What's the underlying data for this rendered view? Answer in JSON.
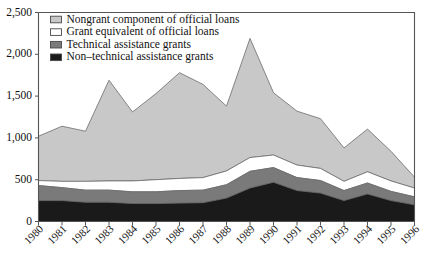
{
  "chart_data": {
    "type": "area",
    "stacked": true,
    "title": "",
    "subtitle": "",
    "xlabel": "",
    "ylabel": "",
    "grid": false,
    "legend_position": "top-left",
    "categories": [
      "1980",
      "1981",
      "1982",
      "1983",
      "1984",
      "1985",
      "1986",
      "1987",
      "1988",
      "1989",
      "1990",
      "1991",
      "1992",
      "1993",
      "1994",
      "1995",
      "1996"
    ],
    "x": [
      1980,
      1981,
      1982,
      1983,
      1984,
      1985,
      1986,
      1987,
      1988,
      1989,
      1990,
      1991,
      1992,
      1993,
      1994,
      1995,
      1996
    ],
    "ylim": [
      0,
      2500
    ],
    "xlim": [
      1980,
      1996
    ],
    "ytick_labels": [
      "0",
      "500",
      "1,000",
      "1,500",
      "2,000",
      "2,500"
    ],
    "ytick_values": [
      0,
      500,
      1000,
      1500,
      2000,
      2500
    ],
    "series": [
      {
        "name": "Non-technical assistance grants",
        "color": "#1a1a1a",
        "values": [
          250,
          250,
          230,
          230,
          215,
          215,
          220,
          225,
          280,
          400,
          470,
          370,
          340,
          250,
          330,
          250,
          200
        ]
      },
      {
        "name": "Technical assistance grants",
        "color": "#7a7a7a",
        "values": [
          180,
          155,
          145,
          145,
          140,
          140,
          150,
          150,
          160,
          200,
          175,
          155,
          150,
          120,
          130,
          110,
          95
        ]
      },
      {
        "name": "Grant equivalent of official loans",
        "color": "#ffffff",
        "values": [
          60,
          75,
          105,
          110,
          130,
          145,
          145,
          150,
          165,
          165,
          150,
          150,
          145,
          110,
          135,
          125,
          105
        ]
      },
      {
        "name": "Nongrant component of official loans",
        "color": "#c8c8c8",
        "values": [
          530,
          660,
          600,
          1205,
          825,
          1030,
          1265,
          1115,
          775,
          1425,
          745,
          645,
          595,
          400,
          510,
          355,
          130
        ]
      }
    ],
    "stack_tops": {
      "non_technical": [
        250,
        250,
        230,
        230,
        215,
        215,
        220,
        225,
        280,
        400,
        470,
        370,
        340,
        250,
        330,
        250,
        200
      ],
      "technical": [
        430,
        405,
        375,
        375,
        355,
        355,
        370,
        375,
        440,
        600,
        645,
        525,
        490,
        370,
        460,
        360,
        295
      ],
      "grant_equivalent": [
        490,
        480,
        480,
        485,
        485,
        500,
        515,
        525,
        605,
        765,
        795,
        675,
        635,
        480,
        595,
        485,
        400
      ],
      "total": [
        1020,
        1140,
        1080,
        1690,
        1310,
        1530,
        1780,
        1640,
        1380,
        2190,
        1540,
        1320,
        1230,
        880,
        1105,
        840,
        530
      ]
    },
    "legend": [
      {
        "label": "Nongrant component of official loans",
        "swatch": "#c8c8c8",
        "swatch_kind": "light-gray-box"
      },
      {
        "label": "Grant equivalent of official loans",
        "swatch": "#ffffff",
        "swatch_kind": "white-box"
      },
      {
        "label": "Technical assistance grants",
        "swatch": "#7a7a7a",
        "swatch_kind": "mid-gray-box"
      },
      {
        "label": "Non–technical assistance grants",
        "swatch": "#1a1a1a",
        "swatch_kind": "black-box"
      }
    ]
  }
}
